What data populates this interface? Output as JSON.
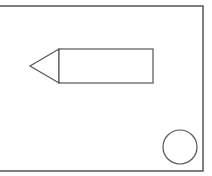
{
  "diagram": {
    "background": "#ffffff",
    "stroke_color": "#555555",
    "frame": {
      "x": -2,
      "y": 6,
      "width": 205,
      "height": 165
    },
    "pencil": {
      "body": {
        "x": 59,
        "y": 49,
        "width": 94,
        "height": 34
      },
      "tip_point": [
        30,
        66
      ]
    },
    "circle": {
      "cx": 180,
      "cy": 147,
      "r": 17
    }
  }
}
